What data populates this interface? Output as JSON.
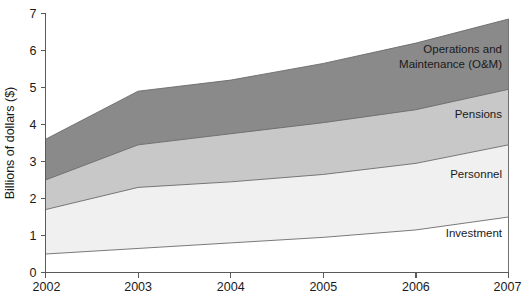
{
  "chart_data": {
    "type": "area",
    "stacked": true,
    "title": "",
    "subtitle": "",
    "xlabel": "",
    "ylabel": "Billions of  dollars ($)",
    "categories": [
      "2002",
      "2003",
      "2004",
      "2005",
      "2006",
      "2007"
    ],
    "x": [
      2002,
      2003,
      2004,
      2005,
      2006,
      2007
    ],
    "xlim": [
      2002,
      2007
    ],
    "ylim": [
      0,
      7
    ],
    "yticks": [
      0,
      1,
      2,
      3,
      4,
      5,
      6,
      7
    ],
    "ytick_labels": [
      "0",
      "1",
      "2",
      "3",
      "4",
      "5",
      "6",
      "7"
    ],
    "xticks": [
      2002,
      2003,
      2004,
      2005,
      2006,
      2007
    ],
    "xtick_labels": [
      "2002",
      "2003",
      "2004",
      "2005",
      "2006",
      "2007"
    ],
    "grid": false,
    "legend_position": "inline-right",
    "series": [
      {
        "name": "Investment",
        "label": "Investment",
        "color": "#ffffff",
        "values": [
          0.5,
          0.65,
          0.8,
          0.95,
          1.15,
          1.5
        ],
        "cumulative_top": [
          0.5,
          0.65,
          0.8,
          0.95,
          1.15,
          1.5
        ]
      },
      {
        "name": "Personnel",
        "label": "Personnel",
        "color": "#f0f0f0",
        "values": [
          1.2,
          1.65,
          1.65,
          1.7,
          1.8,
          1.95
        ],
        "cumulative_top": [
          1.7,
          2.3,
          2.45,
          2.65,
          2.95,
          3.45
        ]
      },
      {
        "name": "Pensions",
        "label": "Pensions",
        "color": "#c8c8c8",
        "values": [
          0.8,
          1.15,
          1.3,
          1.4,
          1.45,
          1.5
        ],
        "cumulative_top": [
          2.5,
          3.45,
          3.75,
          4.05,
          4.4,
          4.95
        ]
      },
      {
        "name": "Operations and Maintenance (O&M)",
        "label": "Operations and Maintenance (O&M)",
        "label_lines": [
          "Operations and",
          "Maintenance (O&M)"
        ],
        "color": "#8a8a8a",
        "values": [
          1.1,
          1.45,
          1.45,
          1.6,
          1.8,
          1.9
        ],
        "cumulative_top": [
          3.6,
          4.9,
          5.2,
          5.65,
          6.2,
          6.85
        ]
      }
    ],
    "totals": [
      3.6,
      4.9,
      5.2,
      5.65,
      6.2,
      6.85
    ],
    "colors": {
      "investment": "#ffffff",
      "personnel": "#f0f0f0",
      "pensions": "#c8c8c8",
      "om": "#8a8a8a",
      "axis": "#5a5a5a",
      "outline": "#6b6b6b",
      "text": "#1a1a1a",
      "background": "#ffffff"
    }
  }
}
